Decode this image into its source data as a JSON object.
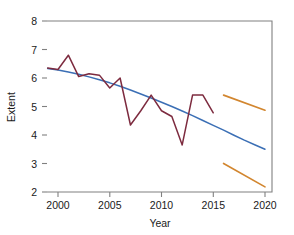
{
  "chart_data": {
    "type": "line",
    "title": "",
    "xlabel": "Year",
    "ylabel": "Extent",
    "xlim": [
      1999,
      2020.5
    ],
    "ylim": [
      2,
      8
    ],
    "grid": false,
    "legend": "none",
    "xticks": [
      2000,
      2005,
      2010,
      2015,
      2020
    ],
    "yticks": [
      2,
      3,
      4,
      5,
      6,
      7,
      8
    ],
    "colors": {
      "observed": "#7d2b3f",
      "trend": "#3b6fb5",
      "projection": "#d2862f",
      "axis": "#808080",
      "text": "#1a1a1a",
      "background": "#ffffff"
    },
    "series": [
      {
        "name": "Observed extent",
        "type": "line",
        "color": "#7d2b3f",
        "x": [
          1999,
          2000,
          2001,
          2002,
          2003,
          2004,
          2005,
          2006,
          2007,
          2008,
          2009,
          2010,
          2011,
          2012,
          2013,
          2014,
          2015
        ],
        "values": [
          6.35,
          6.3,
          6.8,
          6.05,
          6.15,
          6.1,
          5.65,
          6.0,
          4.35,
          4.85,
          5.4,
          4.85,
          4.65,
          3.65,
          5.4,
          5.4,
          4.78
        ]
      },
      {
        "name": "Fitted trend",
        "type": "line",
        "color": "#3b6fb5",
        "x": [
          1999,
          2000,
          2001,
          2002,
          2003,
          2004,
          2005,
          2006,
          2007,
          2008,
          2009,
          2010,
          2011,
          2012,
          2013,
          2014,
          2015,
          2016,
          2017,
          2018,
          2019,
          2020
        ],
        "values": [
          6.33,
          6.28,
          6.21,
          6.13,
          6.04,
          5.94,
          5.83,
          5.71,
          5.58,
          5.44,
          5.3,
          5.15,
          5.0,
          4.84,
          4.68,
          4.51,
          4.34,
          4.17,
          3.99,
          3.82,
          3.66,
          3.5
        ]
      },
      {
        "name": "Projection upper bound",
        "type": "line",
        "color": "#d2862f",
        "x": [
          2016,
          2020
        ],
        "values": [
          5.4,
          4.87
        ]
      },
      {
        "name": "Projection lower bound",
        "type": "line",
        "color": "#d2862f",
        "x": [
          2016,
          2020
        ],
        "values": [
          3.0,
          2.18
        ]
      }
    ]
  },
  "axes": {
    "x_title": "Year",
    "y_title": "Extent",
    "x_tick_labels": [
      "2000",
      "2005",
      "2010",
      "2015",
      "2020"
    ],
    "y_tick_labels": [
      "2",
      "3",
      "4",
      "5",
      "6",
      "7",
      "8"
    ]
  }
}
